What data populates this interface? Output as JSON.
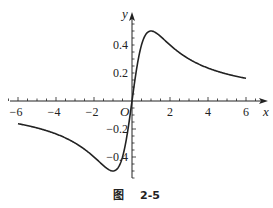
{
  "chart_data": {
    "type": "line",
    "title": "",
    "function": "y = x/(1+x^2)",
    "xlabel": "x",
    "ylabel": "y",
    "origin_label": "O",
    "xlim": [
      -6,
      6
    ],
    "ylim": [
      -0.5,
      0.5
    ],
    "x_ticks": [
      -6,
      -4,
      -2,
      2,
      4,
      6
    ],
    "x_tick_labels": [
      "-6",
      "-4",
      "-2",
      "2",
      "4",
      "6"
    ],
    "y_ticks": [
      0.4,
      0.2,
      -0.2,
      -0.4
    ],
    "y_tick_labels": [
      "0.4",
      "0.2",
      "-0.2",
      "-0.4"
    ],
    "grid": false,
    "legend": null,
    "series": [
      {
        "name": "f(x)",
        "color": "#222222",
        "x": [
          -6,
          -5,
          -4,
          -3,
          -2,
          -1.5,
          -1,
          -0.5,
          0,
          0.5,
          1,
          1.5,
          2,
          3,
          4,
          5,
          6
        ],
        "y": [
          -0.162,
          -0.192,
          -0.235,
          -0.3,
          -0.4,
          -0.462,
          -0.5,
          -0.4,
          0,
          0.4,
          0.5,
          0.462,
          0.4,
          0.3,
          0.235,
          0.192,
          0.162
        ]
      }
    ]
  },
  "caption": {
    "prefix": "图",
    "number": "2-5"
  }
}
